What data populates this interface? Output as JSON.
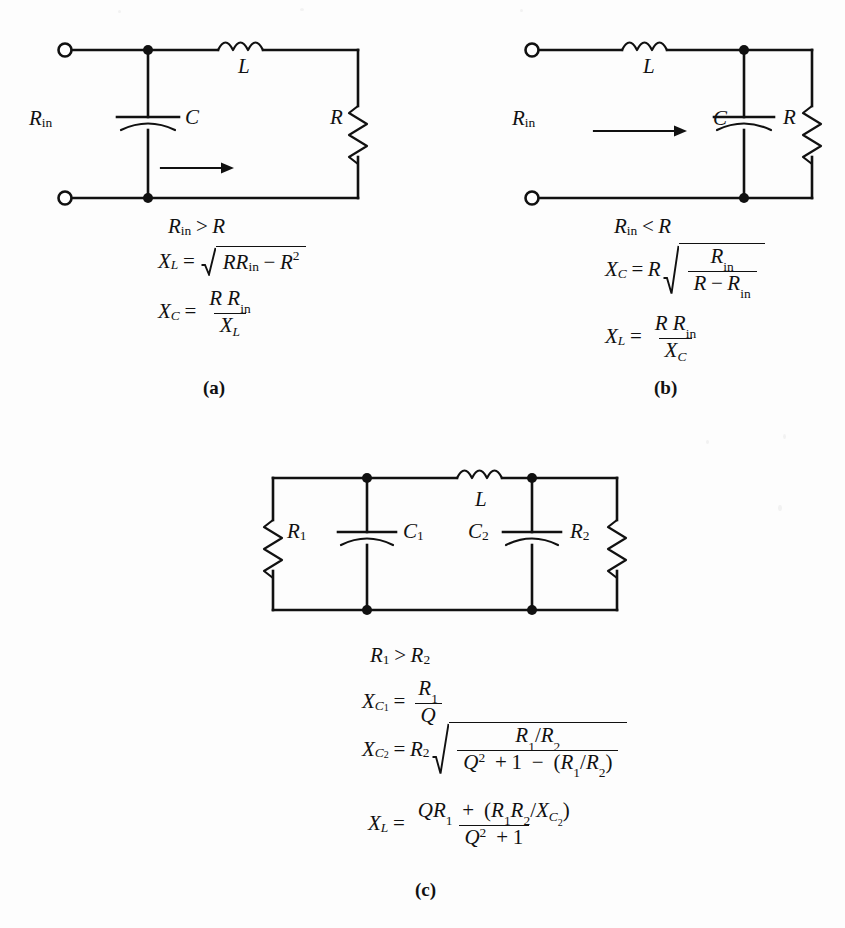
{
  "figure": {
    "type": "L-network impedance matching circuits",
    "panels": [
      {
        "id": "a",
        "caption": "(a)",
        "components": {
          "input_label": "R",
          "input_sub": "in",
          "inductor": "L",
          "capacitor": "C",
          "resistor": "R"
        },
        "topology": "shunt C at input, series L, load R",
        "condition": {
          "lhs": "R",
          "lhs_sub": "in",
          "rel": ">",
          "rhs": "R"
        },
        "equations": [
          {
            "lhs": "X",
            "lhs_sub": "L",
            "rel": "=",
            "rhs_tex": "sqrt(R*R_in - R^2)"
          },
          {
            "lhs": "X",
            "lhs_sub": "C",
            "rel": "=",
            "rhs_tex": "(R R_in)/X_L"
          }
        ]
      },
      {
        "id": "b",
        "caption": "(b)",
        "components": {
          "input_label": "R",
          "input_sub": "in",
          "inductor": "L",
          "capacitor": "C",
          "resistor": "R"
        },
        "topology": "series L at input, shunt C, load R",
        "condition": {
          "lhs": "R",
          "lhs_sub": "in",
          "rel": "<",
          "rhs": "R"
        },
        "equations": [
          {
            "lhs": "X",
            "lhs_sub": "C",
            "rel": "=",
            "rhs_tex": "R*sqrt(R_in/(R - R_in))"
          },
          {
            "lhs": "X",
            "lhs_sub": "L",
            "rel": "=",
            "rhs_tex": "(R R_in)/X_C"
          }
        ]
      },
      {
        "id": "c",
        "caption": "(c)",
        "components": {
          "resistor_left": "R",
          "resistor_left_sub": "1",
          "capacitor_left": "C",
          "capacitor_left_sub": "1",
          "inductor": "L",
          "capacitor_right": "C",
          "capacitor_right_sub": "2",
          "resistor_right": "R",
          "resistor_right_sub": "2"
        },
        "topology": "pi network: R1 shunt, C1 shunt, series L, C2 shunt, R2 shunt",
        "condition": {
          "lhs": "R",
          "lhs_sub": "1",
          "rel": ">",
          "rhs": "R",
          "rhs_sub": "2"
        },
        "equations": [
          {
            "lhs": "X",
            "lhs_sub": "C1",
            "rel": "=",
            "rhs_tex": "R_1/Q"
          },
          {
            "lhs": "X",
            "lhs_sub": "C2",
            "rel": "=",
            "rhs_tex": "R_2*sqrt((R_1/R_2)/(Q^2 + 1 - (R_1/R_2)))"
          },
          {
            "lhs": "X",
            "lhs_sub": "L",
            "rel": "=",
            "rhs_tex": "(Q R_1 + (R_1 R_2 / X_C2))/(Q^2 + 1)"
          }
        ]
      }
    ],
    "symbols": {
      "X": "X",
      "R": "R",
      "C": "C",
      "L": "L",
      "Q": "Q",
      "in": "in",
      "one": "1",
      "two": "2",
      "gt": ">",
      "lt": "<",
      "eq": "=",
      "plus": "+",
      "minus": "−",
      "slash": "/",
      "lparen": "(",
      "rparen": ")",
      "sq": "2"
    },
    "colors": {
      "ink": "#111111",
      "paper": "#fdfdfd"
    }
  }
}
